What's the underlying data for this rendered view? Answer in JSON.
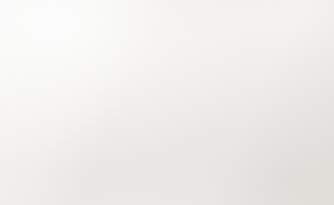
{
  "chart_data": {
    "type": "bar",
    "title": "YUNLIN  COUNTY NUMBER OF ELDERLY (65 years old +)",
    "xlabel": "",
    "ylabel": "",
    "grid": false,
    "legend": false,
    "categories": [
      "1998",
      "1999",
      "2000",
      "2001",
      "2002",
      "2003",
      "2004",
      "2005",
      "2006",
      "2007",
      "2008",
      "2009",
      "2010",
      "2011",
      "2012",
      "2013",
      "2014"
    ],
    "values": [
      110,
      118,
      126,
      130,
      137,
      140,
      146,
      151,
      155,
      160,
      164,
      164,
      163,
      166,
      171,
      174,
      178
    ],
    "ylim": [
      0,
      200
    ],
    "bar_color": "#bdbdbd",
    "note": "Y axis tick labels are printed on the original but are washed out and illegible; bar values are read as relative heights off the baseline.",
    "y_tick_labels": [
      "",
      "",
      "",
      "",
      "",
      "",
      "",
      "",
      "",
      "",
      "",
      "",
      "",
      "",
      "",
      "",
      "",
      "",
      "",
      "",
      "",
      "",
      "",
      "",
      "",
      "",
      "",
      "",
      "",
      ""
    ]
  },
  "frame": {
    "background": "#fdfdfd",
    "border_color": "#dcdbd8",
    "page_background": "#f2f1ef"
  }
}
